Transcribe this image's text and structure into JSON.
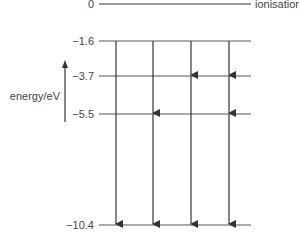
{
  "diagram": {
    "title": "",
    "axis_label": "energy/eV",
    "ionisation_label": "ionisation",
    "levels": [
      {
        "value": "0",
        "y": 4,
        "x1": 99,
        "x2": 251
      },
      {
        "value": "−1.6",
        "y": 41,
        "x1": 99,
        "x2": 251
      },
      {
        "value": "−3.7",
        "y": 76,
        "x1": 99,
        "x2": 251
      },
      {
        "value": "−5.5",
        "y": 114,
        "x1": 99,
        "x2": 251
      },
      {
        "value": "−10.4",
        "y": 225,
        "x1": 99,
        "x2": 251
      }
    ],
    "transitions": [
      {
        "column": 1,
        "from": "−1.6",
        "to": "−10.4"
      },
      {
        "column": 2,
        "from": "−1.6",
        "to": "−5.5"
      },
      {
        "column": 2,
        "from": "−5.5",
        "to": "−10.4"
      },
      {
        "column": 3,
        "from": "−1.6",
        "to": "−3.7"
      },
      {
        "column": 3,
        "from": "−3.7",
        "to": "−10.4"
      },
      {
        "column": 4,
        "from": "−1.6",
        "to": "−3.7"
      },
      {
        "column": 4,
        "from": "−3.7",
        "to": "−5.5"
      },
      {
        "column": 4,
        "from": "−5.5",
        "to": "−10.4"
      }
    ],
    "colors": {
      "line": "#333333",
      "text": "#444444"
    }
  }
}
